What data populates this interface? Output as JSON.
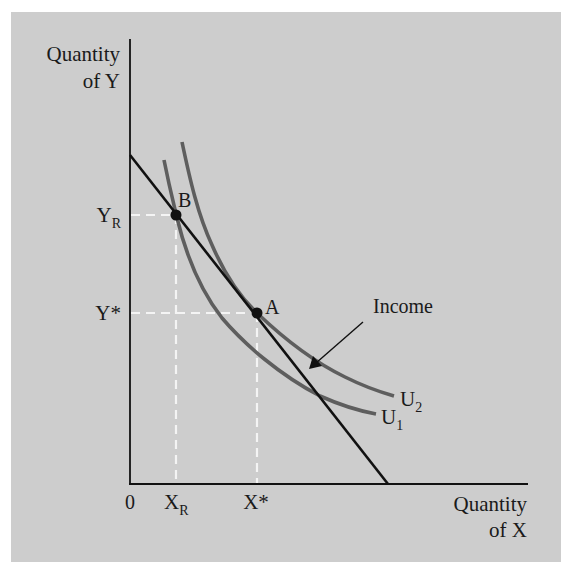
{
  "diagram": {
    "type": "indifference-curve-budget-line",
    "background_color": "#cdcdcd",
    "curve_color": "#5e5e5e",
    "line_color": "#111111",
    "guide_color": "#f4f4f4",
    "axes": {
      "y_label_line1": "Quantity",
      "y_label_line2": "of Y",
      "x_label_line1": "Quantity",
      "x_label_line2": "of X",
      "origin_label": "0"
    },
    "ticks": {
      "y": [
        {
          "base": "Y",
          "sub": "R",
          "id": "YR"
        },
        {
          "base": "Y*",
          "sub": "",
          "id": "Ystar"
        }
      ],
      "x": [
        {
          "base": "X",
          "sub": "R",
          "id": "XR"
        },
        {
          "base": "X*",
          "sub": "",
          "id": "Xstar"
        }
      ]
    },
    "points": [
      {
        "label": "B",
        "description": "Intersection of budget line and U1 at (XR, YR)"
      },
      {
        "label": "A",
        "description": "Tangency of budget line and U2 at (X*, Y*)"
      }
    ],
    "curves": [
      {
        "label_base": "U",
        "label_sub": "1",
        "description": "Lower indifference curve through B"
      },
      {
        "label_base": "U",
        "label_sub": "2",
        "description": "Higher indifference curve tangent at A"
      }
    ],
    "budget_line_annotation": "Income"
  }
}
